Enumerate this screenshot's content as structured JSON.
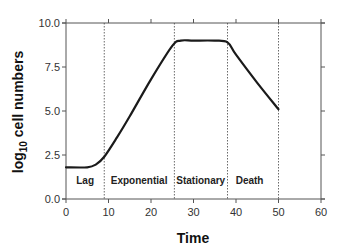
{
  "chart_data": {
    "type": "line",
    "title": "",
    "xlabel": "Time",
    "ylabel": "log10 cell numbers",
    "ylabel_parts": {
      "pre": "log",
      "sub": "10",
      "post": " cell numbers"
    },
    "xlim": [
      0,
      60
    ],
    "ylim": [
      0,
      10
    ],
    "x_ticks": [
      0,
      10,
      20,
      30,
      40,
      50,
      60
    ],
    "x_tick_labels": [
      "0",
      "10",
      "20",
      "30",
      "40",
      "50",
      "60"
    ],
    "y_ticks": [
      0,
      2.5,
      5,
      7.5,
      10
    ],
    "y_tick_labels": [
      "0.0",
      "2.5",
      "5.0",
      "7.5",
      "10.0"
    ],
    "grid": false,
    "legend": null,
    "series": [
      {
        "name": "growth curve",
        "x": [
          0,
          5,
          7,
          9,
          12,
          15,
          20,
          25,
          27,
          30,
          35,
          38,
          40,
          45,
          50
        ],
        "y": [
          1.8,
          1.8,
          1.95,
          2.4,
          3.5,
          4.7,
          6.8,
          8.7,
          9.0,
          9.0,
          9.0,
          8.9,
          8.2,
          6.6,
          5.1
        ]
      }
    ],
    "phase_boundaries": [
      9,
      25.5,
      38,
      50
    ],
    "phases": [
      {
        "label": "Lag",
        "x_center": 4.5
      },
      {
        "label": "Exponential",
        "x_center": 17.2
      },
      {
        "label": "Stationary",
        "x_center": 31.7
      },
      {
        "label": "Death",
        "x_center": 43.2
      }
    ]
  },
  "style": {
    "line_color": "#1a1a1a",
    "axis_color": "#555555",
    "divider_color": "#444444"
  }
}
